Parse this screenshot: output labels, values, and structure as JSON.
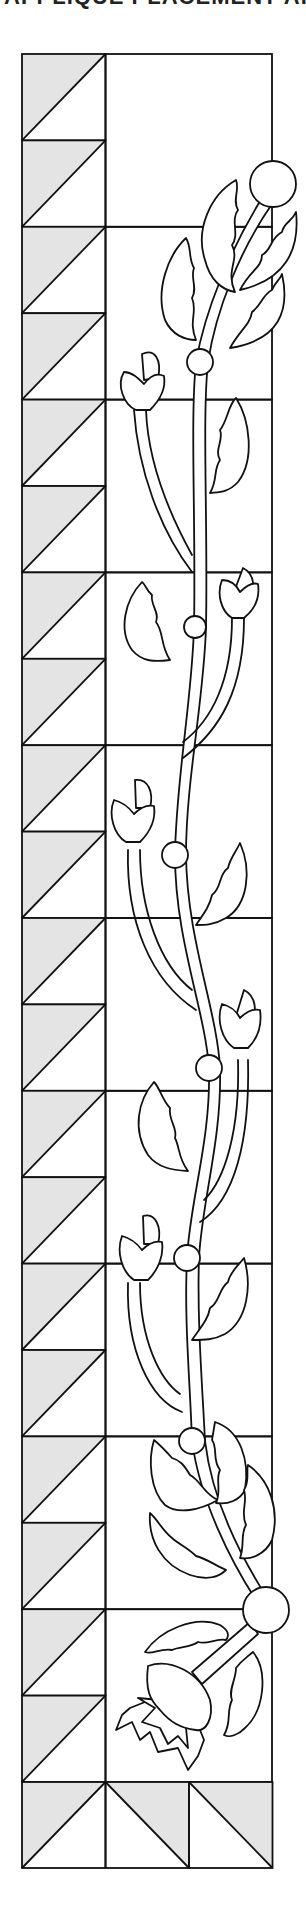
{
  "header": {
    "title": "APPLIQUÉ PLACEMENT ARTWORK"
  },
  "colors": {
    "line": "#111111",
    "shaded_triangle": "#e4e4e4",
    "background": "#ffffff"
  },
  "quilt": {
    "left_column_triangle_rows": 20,
    "right_panel_blocks": 10,
    "bottom_row_squares": 3,
    "triangle_orientation_left": "shaded-top-left",
    "triangle_orientation_bottom": [
      "shaded-top-left",
      "shaded-top-right",
      "shaded-top-right"
    ]
  },
  "applique": {
    "stem_nodes": 8,
    "large_circles": 2,
    "tulip_buds": 6,
    "leaves": 15,
    "open_flowers": 1
  }
}
